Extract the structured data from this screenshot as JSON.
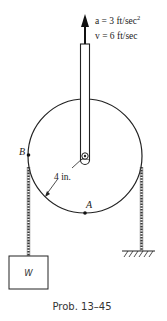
{
  "annotations": {
    "acceleration_label": "a = 3 ft/sec",
    "acceleration_exp": "2",
    "velocity_label": "v = 6 ft/sec",
    "radius_label": "4 in.",
    "point_a_label": "A",
    "point_b_label": "B",
    "weight_label": "W"
  },
  "caption": "Prob. 13–45",
  "colors": {
    "ink": "#222222",
    "background": "#ffffff"
  }
}
